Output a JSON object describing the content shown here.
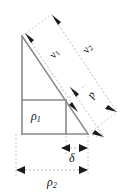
{
  "figure": {
    "type": "geometric-diagram",
    "background_color": "#ffffff",
    "solid_line_color": "#8a8a8a",
    "dashed_line_color": "#a8a8a8",
    "arrow_color": "#1a1a1a",
    "label_color": "#111111"
  },
  "labels": {
    "v1": {
      "base": "v",
      "sub": "1",
      "full": "v1"
    },
    "v2": {
      "base": "v",
      "sub": "2",
      "full": "v2"
    },
    "p": {
      "base": "p",
      "sub": "",
      "full": "p"
    },
    "rho1": {
      "base": "ρ",
      "sub": "1",
      "full": "ρ1"
    },
    "delta": {
      "base": "δ",
      "sub": "",
      "full": "δ"
    },
    "rho2": {
      "base": "ρ",
      "sub": "2",
      "full": "ρ2"
    }
  },
  "geometry": {
    "triangle": {
      "apex": [
        22,
        36
      ],
      "bottom_left": [
        22,
        134
      ],
      "bottom_right": [
        88,
        134
      ]
    },
    "inner_rectangle": {
      "left": 22,
      "top": 100,
      "right": 66,
      "bottom": 134
    },
    "dimensions": [
      {
        "name": "v1",
        "kind": "diagonal",
        "from": [
          24,
          34
        ],
        "to": [
          77,
          113
        ]
      },
      {
        "name": "v2",
        "kind": "diagonal",
        "from": [
          50,
          16
        ],
        "to": [
          115,
          113
        ]
      },
      {
        "name": "p",
        "kind": "diagonal",
        "from": [
          69,
          86
        ],
        "to": [
          103,
          136
        ]
      },
      {
        "name": "delta",
        "kind": "horizontal",
        "from": [
          61,
          148
        ],
        "to": [
          88,
          148
        ]
      },
      {
        "name": "rho2",
        "kind": "horizontal",
        "from": [
          16,
          170
        ],
        "to": [
          88,
          170
        ]
      }
    ]
  }
}
